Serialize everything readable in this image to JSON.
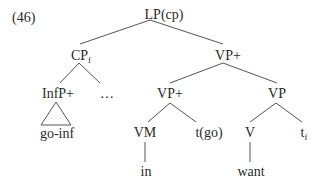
{
  "example_number": "(46)",
  "tree": {
    "root": "LP(cp)",
    "nodes": {
      "lp": {
        "label": "LP(cp)"
      },
      "cp": {
        "label": "CP",
        "sub": "f"
      },
      "vp_plus_top": {
        "label": "VP+"
      },
      "infp": {
        "label": "InfP+"
      },
      "ellipsis": {
        "label": "…"
      },
      "vp_plus_low": {
        "label": "VP+"
      },
      "vp": {
        "label": "VP"
      },
      "go_inf": {
        "label": "go-inf"
      },
      "vm": {
        "label": "VM"
      },
      "t_go": {
        "label": "t(go)"
      },
      "v": {
        "label": "V"
      },
      "t_f": {
        "label": "t",
        "sub": "f"
      },
      "in": {
        "label": "in"
      },
      "want": {
        "label": "want"
      }
    },
    "edges": [
      [
        "LP(cp)",
        "CPf"
      ],
      [
        "LP(cp)",
        "VP+"
      ],
      [
        "CPf",
        "InfP+"
      ],
      [
        "CPf",
        "…"
      ],
      [
        "InfP+",
        "go-inf (triangle)"
      ],
      [
        "VP+",
        "VP+"
      ],
      [
        "VP+",
        "VP"
      ],
      [
        "VP+",
        "VM"
      ],
      [
        "VP+",
        "t(go)"
      ],
      [
        "VP",
        "V"
      ],
      [
        "VP",
        "tf"
      ],
      [
        "VM",
        "in"
      ],
      [
        "V",
        "want"
      ]
    ]
  }
}
